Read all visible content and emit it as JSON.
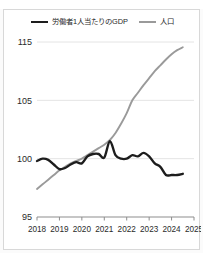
{
  "title_strip": {
    "text": ""
  },
  "legend": {
    "position": "top-center",
    "entries": [
      {
        "label": "労働者1人当たりのGDP",
        "color": "#1d1d1d",
        "icon": "line-swatch-icon"
      },
      {
        "label": "人口",
        "color": "#9a9a9a",
        "icon": "line-swatch-icon"
      }
    ]
  },
  "chart_data": {
    "type": "line",
    "title": "",
    "subtitle": "",
    "xlabel": "",
    "ylabel": "",
    "grid": true,
    "legend_position": "top-center",
    "index_base": 100,
    "x": [
      2018.0,
      2018.25,
      2018.5,
      2018.75,
      2019.0,
      2019.25,
      2019.5,
      2019.75,
      2020.0,
      2020.25,
      2020.5,
      2020.75,
      2021.0,
      2021.25,
      2021.5,
      2021.75,
      2022.0,
      2022.25,
      2022.5,
      2022.75,
      2023.0,
      2023.25,
      2023.5,
      2023.75,
      2024.0,
      2024.25,
      2024.5
    ],
    "xlim": [
      2018,
      2025
    ],
    "xticks": [
      2018,
      2019,
      2020,
      2021,
      2022,
      2023,
      2024,
      2025
    ],
    "xticklabels": [
      "2018",
      "2019",
      "2020",
      "2021",
      "2022",
      "2023",
      "2024",
      "2025"
    ],
    "ylim": [
      95,
      115
    ],
    "yticks": [
      95,
      100,
      105,
      115
    ],
    "yticklabels": [
      "95",
      "100",
      "105",
      "115"
    ],
    "y_axis_note": "non-linear spacing: 95-100-105 evenly spaced, 105-115 compressed",
    "series": [
      {
        "name": "労働者1人当たりのGDP",
        "color": "#1d1d1d",
        "values": [
          99.8,
          100.0,
          99.9,
          99.5,
          99.1,
          99.2,
          99.5,
          99.7,
          99.6,
          100.2,
          100.4,
          100.4,
          100.1,
          101.5,
          100.3,
          100.0,
          100.0,
          100.3,
          100.2,
          100.5,
          100.2,
          99.6,
          99.3,
          98.6,
          98.6,
          98.6,
          98.7
        ]
      },
      {
        "name": "人口",
        "color": "#9a9a9a",
        "values": [
          97.4,
          97.8,
          98.2,
          98.6,
          99.0,
          99.3,
          99.6,
          99.8,
          100.0,
          100.3,
          100.6,
          100.9,
          101.2,
          101.6,
          102.2,
          103.0,
          103.9,
          105.0,
          106.3,
          107.6,
          108.8,
          110.0,
          111.0,
          112.0,
          112.9,
          113.6,
          114.1
        ]
      }
    ]
  }
}
